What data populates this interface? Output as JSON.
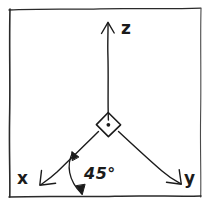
{
  "figure": {
    "background_color": "#ffffff",
    "ink_color": "#1b1b1b",
    "width": 211,
    "height": 210
  },
  "frame": {
    "name": "hand-drawn rectangular border",
    "stroke_color": "#2a2a2a"
  },
  "axes": [
    {
      "id": "z",
      "label": "z",
      "direction": "up",
      "arrow": "single-head",
      "origin": [
        108,
        120
      ],
      "tip": [
        108,
        22
      ]
    },
    {
      "id": "x",
      "label": "x",
      "direction": "down-left",
      "arrow": "single-head",
      "origin": [
        98,
        131
      ],
      "tip": [
        40,
        184
      ]
    },
    {
      "id": "y",
      "label": "y",
      "direction": "down-right",
      "arrow": "single-head",
      "origin": [
        119,
        131
      ],
      "tip": [
        181,
        183
      ]
    }
  ],
  "origin_marker": {
    "name": "right-angle diamond with center dot",
    "center": [
      108,
      125
    ]
  },
  "annotation": {
    "angle_label": "45°",
    "arc": {
      "name": "double-headed angle arc",
      "from": [
        72,
        153
      ],
      "to": [
        82,
        194
      ]
    }
  }
}
